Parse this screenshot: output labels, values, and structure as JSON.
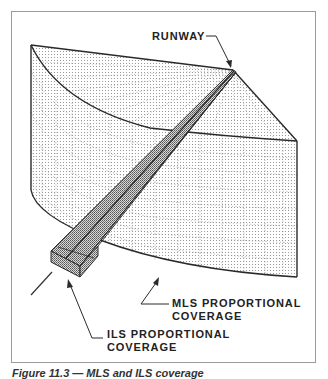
{
  "figure": {
    "labels": {
      "runway": "RUNWAY",
      "mls_line1": "MLS PROPORTIONAL",
      "mls_line2": "COVERAGE",
      "ils_line1": "ILS PROPORTIONAL",
      "ils_line2": "COVERAGE"
    },
    "caption": "Figure 11.3 — MLS and ILS coverage",
    "colors": {
      "line": "#2a2a2a",
      "grid": "#8a8a8a",
      "frame": "#9a9a9a",
      "beam_fill": "#bdbdbd"
    }
  }
}
